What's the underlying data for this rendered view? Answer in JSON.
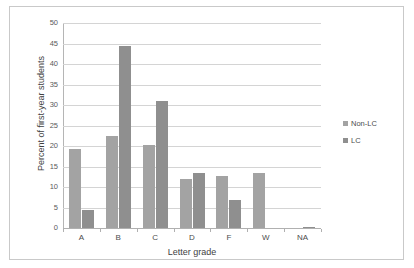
{
  "chart_data": {
    "type": "bar",
    "title": "",
    "xlabel": "Letter grade",
    "ylabel": "Percent of first-year students",
    "categories": [
      "A",
      "B",
      "C",
      "D",
      "F",
      "W",
      "NA"
    ],
    "series": [
      {
        "name": "Non-LC",
        "color": "#a3a3a3",
        "values": [
          19.2,
          22.4,
          20.2,
          12.0,
          12.7,
          13.4,
          0.0
        ]
      },
      {
        "name": "LC",
        "color": "#8f8f8f",
        "values": [
          4.3,
          44.5,
          31.0,
          13.4,
          6.8,
          0.0,
          0.3
        ]
      }
    ],
    "ylim": [
      0,
      50
    ],
    "ytick_values": [
      0,
      5,
      10,
      15,
      20,
      25,
      30,
      35,
      40,
      45,
      50
    ],
    "ytick_labels": [
      "0",
      "5",
      "10",
      "15",
      "20",
      "25",
      "30",
      "35",
      "40",
      "45",
      "50"
    ],
    "grid": true,
    "legend_position": "right",
    "frame": true,
    "plot_background": "#ffffff",
    "gridline_color": "#d4d4d4",
    "axis_color": "#b5b5b5",
    "frame_color": "#c9c9c9"
  }
}
